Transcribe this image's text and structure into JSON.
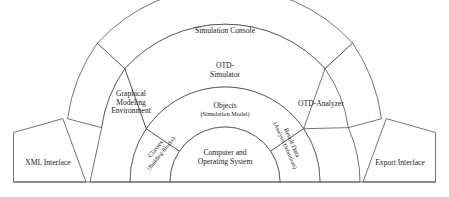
{
  "diagram": {
    "type": "concentric-semicircle-layers",
    "stroke_color": "#3a3a3a",
    "fill_color": "#ffffff",
    "background_color": "#ffffff",
    "layers": [
      {
        "ring": 1,
        "name": "core",
        "label": "Computer and",
        "label_line2": "Operating System"
      },
      {
        "ring": 2,
        "name": "model-layer",
        "center_label": "Objects",
        "center_sublabel": "(Simulation Model)",
        "left_label": "Classes",
        "left_sublabel": "(Building Blocks)",
        "right_label": "Result Data",
        "right_sublabel": "(Analysis Definitions)"
      },
      {
        "ring": 3,
        "name": "tool-layer",
        "center_label": "OTD-",
        "center_label2": "Simulator",
        "left_label": "Graphical",
        "left_label2": "Modeling",
        "left_label3": "Environment",
        "right_label": "OTD-Analyzer"
      },
      {
        "ring": 4,
        "name": "console-layer",
        "center_label": "Simulation Console"
      }
    ],
    "interfaces": {
      "left": "XML Interface",
      "right": "Export Interface"
    }
  }
}
